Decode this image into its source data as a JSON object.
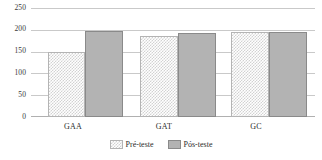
{
  "chart_data": {
    "type": "bar",
    "title": "",
    "xlabel": "",
    "ylabel": "",
    "ylim": [
      0,
      250
    ],
    "yticks": [
      0,
      50,
      100,
      150,
      200,
      250
    ],
    "ytick_labels": [
      "0",
      "50",
      "100",
      "150",
      "200",
      "250"
    ],
    "grid": true,
    "legend_position": "bottom",
    "categories": [
      "GAA",
      "GAT",
      "GC"
    ],
    "series": [
      {
        "name": "Pré-teste",
        "values": [
          150,
          187,
          196
        ],
        "fill": "checker-light",
        "color": "#d2d2d2"
      },
      {
        "name": "Pós-teste",
        "values": [
          200,
          194,
          197
        ],
        "fill": "solid",
        "color": "#b3b3b3"
      }
    ]
  },
  "axis": {
    "y_labels": [
      "250",
      "200",
      "150",
      "100",
      "50",
      "0"
    ]
  },
  "categories": [
    {
      "label": "GAA"
    },
    {
      "label": "GAT"
    },
    {
      "label": "GC"
    }
  ],
  "legend": {
    "items": [
      {
        "label": "Pré-teste",
        "swatch": "pattern-checker-swatch"
      },
      {
        "label": "Pós-teste",
        "swatch": "solid-gray-swatch"
      }
    ]
  }
}
